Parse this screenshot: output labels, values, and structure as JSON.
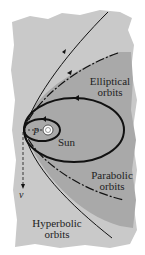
{
  "diagram": {
    "labels": {
      "elliptical": [
        "Elliptical",
        "orbits"
      ],
      "parabolic": [
        "Parabolic",
        "orbits"
      ],
      "hyperbolic": [
        "Hyperbolic",
        "orbits"
      ],
      "sun": "Sun",
      "periapsis": "P",
      "velocity": "v"
    },
    "colors": {
      "outer_region": "#c9c9c9",
      "inner_region": "#a9a9a9",
      "orbit_line": "#111111",
      "sun": "#ffffff"
    }
  }
}
